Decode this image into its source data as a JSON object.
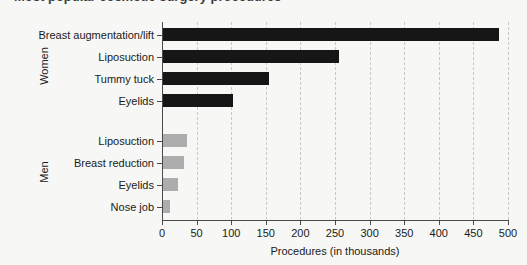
{
  "title_sliver": "Most popular cosmetic surgery procedures",
  "chart_data": {
    "type": "bar",
    "orientation": "horizontal",
    "title": "",
    "xlabel": "Procedures (in thousands)",
    "ylabel": "",
    "xlim": [
      0,
      500
    ],
    "xticks": [
      0,
      50,
      100,
      150,
      200,
      250,
      300,
      350,
      400,
      450,
      500
    ],
    "xtick_labels": [
      "0",
      "50",
      "100",
      "150",
      "200",
      "250",
      "300",
      "350",
      "400",
      "450",
      "500"
    ],
    "grid": "vertical-dashed",
    "legend": "none",
    "groups": [
      {
        "name": "Women",
        "color": "#161616",
        "categories": [
          "Breast augmentation/lift",
          "Liposuction",
          "Tummy tuck",
          "Eyelids"
        ],
        "values": [
          485,
          254,
          153,
          101
        ]
      },
      {
        "name": "Men",
        "color": "#adadad",
        "categories": [
          "Liposuction",
          "Breast reduction",
          "Eyelids",
          "Nose job"
        ],
        "values": [
          35,
          30,
          22,
          10
        ]
      }
    ]
  },
  "colors": {
    "background": "#f7f7f5",
    "women_bar": "#161616",
    "men_bar": "#adadad",
    "axis": "#4a4a4a",
    "gridline": "#c9c9c4",
    "text": "#1a1a1a"
  }
}
